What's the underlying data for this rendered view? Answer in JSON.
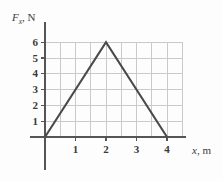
{
  "chart_data": {
    "type": "line",
    "title": "",
    "subtitle": "",
    "xlabel": "x, m",
    "ylabel": "F_x, N",
    "xlabel_symbol": "x",
    "xlabel_unit": ", m",
    "ylabel_symbol": "F",
    "ylabel_subscript": "x",
    "ylabel_unit": ", N",
    "x": [
      0,
      2,
      4
    ],
    "values": [
      0,
      6,
      0
    ],
    "points": [
      {
        "x": 0,
        "y": 0
      },
      {
        "x": 2,
        "y": 6
      },
      {
        "x": 4,
        "y": 0
      }
    ],
    "xlim": [
      0,
      4.5
    ],
    "ylim": [
      0,
      6.6
    ],
    "xticks": [
      1,
      2,
      3,
      4
    ],
    "yticks": [
      1,
      2,
      3,
      4,
      5,
      6
    ],
    "xtick_labels": [
      "1",
      "2",
      "3",
      "4"
    ],
    "ytick_labels": [
      "1",
      "2",
      "3",
      "4",
      "5",
      "6"
    ],
    "x_minor_step": 0.5,
    "grid": true,
    "grid_horizontal_at": [
      1,
      2,
      3,
      4,
      5,
      6
    ],
    "grid_vertical_at": [
      0.5,
      1,
      1.5,
      2,
      2.5,
      3,
      3.5,
      4,
      4.5
    ],
    "legend": [],
    "legend_position": "none",
    "annotations": []
  },
  "colors": {
    "background": "#fdfdfd",
    "axis": "#555558",
    "grid": "#c9c9ce",
    "data_line": "#4a4a4a",
    "text": "#3a3a3a"
  },
  "geometry": {
    "origin_x": 45,
    "origin_y": 137,
    "unit_x": 30.5,
    "unit_y": 15.8,
    "y_axis_top": 22,
    "y_axis_bottom": 170,
    "x_axis_left": 30,
    "x_axis_right": 186
  }
}
